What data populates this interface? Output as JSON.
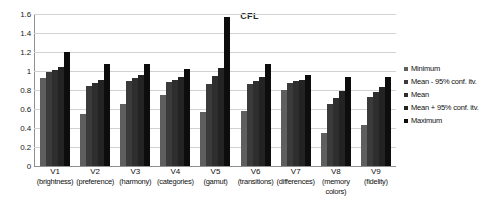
{
  "chart_data": {
    "type": "bar",
    "title": "CFL",
    "xlabel": "",
    "ylabel": "",
    "ylim": [
      0,
      1.6
    ],
    "yticks": [
      "0",
      "0.2",
      "0.4",
      "0.6",
      "0.8",
      "1",
      "1.2",
      "1.4",
      "1.6"
    ],
    "ytick_values": [
      0,
      0.2,
      0.4,
      0.6,
      0.8,
      1.0,
      1.2,
      1.4,
      1.6
    ],
    "grid": true,
    "legend_position": "right",
    "categories": [
      "V1",
      "V2",
      "V3",
      "V4",
      "V5",
      "V6",
      "V7",
      "V8",
      "V9"
    ],
    "category_names": [
      "(brightness)",
      "(preference)",
      "(harmony)",
      "(categories)",
      "(gamut)",
      "(transitions)",
      "(differences)",
      "(memory colors)",
      "(fidelity)"
    ],
    "series": [
      {
        "name": "Minimum",
        "color": "#5e5e5e",
        "values": [
          0.93,
          0.55,
          0.65,
          0.75,
          0.57,
          0.58,
          0.8,
          0.35,
          0.43
        ]
      },
      {
        "name": "Mean - 95% conf. itv.",
        "color": "#3a3a3a",
        "values": [
          0.99,
          0.84,
          0.9,
          0.88,
          0.86,
          0.86,
          0.87,
          0.65,
          0.73
        ]
      },
      {
        "name": "Mean",
        "color": "#2e2e2e",
        "values": [
          1.01,
          0.87,
          0.93,
          0.91,
          0.95,
          0.9,
          0.89,
          0.72,
          0.78
        ]
      },
      {
        "name": "Mean + 95% conf. itv.",
        "color": "#232323",
        "values": [
          1.04,
          0.91,
          0.96,
          0.94,
          1.03,
          0.94,
          0.91,
          0.79,
          0.83
        ]
      },
      {
        "name": "Maximum",
        "color": "#0d0d0d",
        "values": [
          1.2,
          1.07,
          1.07,
          1.02,
          1.57,
          1.07,
          0.96,
          0.94,
          0.94
        ]
      }
    ]
  }
}
